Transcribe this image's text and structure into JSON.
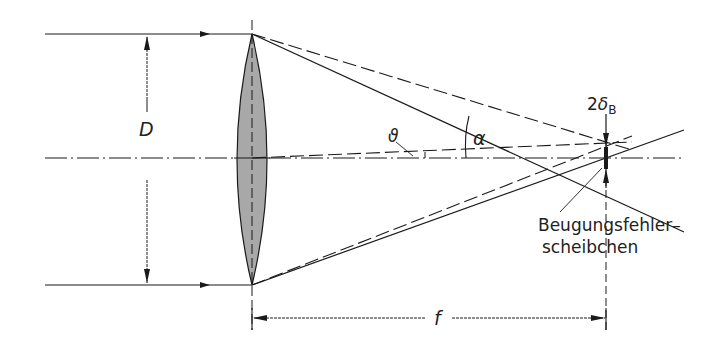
{
  "diagram": {
    "labels": {
      "diameter": "D",
      "focal_length": "f",
      "angle_alpha": "α",
      "angle_theta": "ϑ",
      "spot_size_prefix": "2",
      "spot_size_symbol": "δ",
      "spot_size_subscript": "B",
      "disc_line1": "Beugungsfehler–",
      "disc_line2": "scheibchen"
    },
    "colors": {
      "line": "#1a1a1a",
      "lens_fill": "#a8a8a8",
      "background": "#ffffff"
    }
  }
}
